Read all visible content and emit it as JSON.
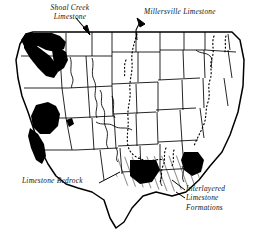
{
  "figure": {
    "type": "map",
    "title": "",
    "region": "Contiguous United States",
    "background_color": "#ffffff",
    "line_color": "#000000",
    "fill_color": "#000000"
  },
  "annotations": [
    {
      "id": "shoal-creek-limestone",
      "label_lines": [
        "Shoal  Creek",
        "Limestone"
      ],
      "label_text": "Shoal Creek Limestone",
      "leader": "arrow pointing down-right",
      "target": "northern Pacific coast black band"
    },
    {
      "id": "millersville-limestone",
      "label_lines": [
        "Millersville  Limestone"
      ],
      "label_text": "Millersville Limestone",
      "leader": "arrow pointing up-left",
      "target": "dotted boundary through Great Plains"
    },
    {
      "id": "limestone-bedrock",
      "label_lines": [
        "Limestone  Bedrock"
      ],
      "label_text": "Limestone Bedrock",
      "leader": "line pointing up-right",
      "target": "black filled Gulf Coast region"
    },
    {
      "id": "interlayered-limestone-formations",
      "label_lines": [
        "Interlayered",
        "Limestone",
        "Formations"
      ],
      "label_text": "Interlayered Limestone Formations",
      "leader": "line pointing up-left",
      "target": "diagonal hatched southeastern region"
    }
  ],
  "legend_patterns": [
    {
      "pattern": "solid-black",
      "meaning": "Limestone Bedrock / Shoal Creek Limestone"
    },
    {
      "pattern": "diagonal-hatch",
      "meaning": "Interlayered Limestone Formations"
    },
    {
      "pattern": "dotted-line",
      "meaning": "Millersville Limestone boundary"
    }
  ]
}
